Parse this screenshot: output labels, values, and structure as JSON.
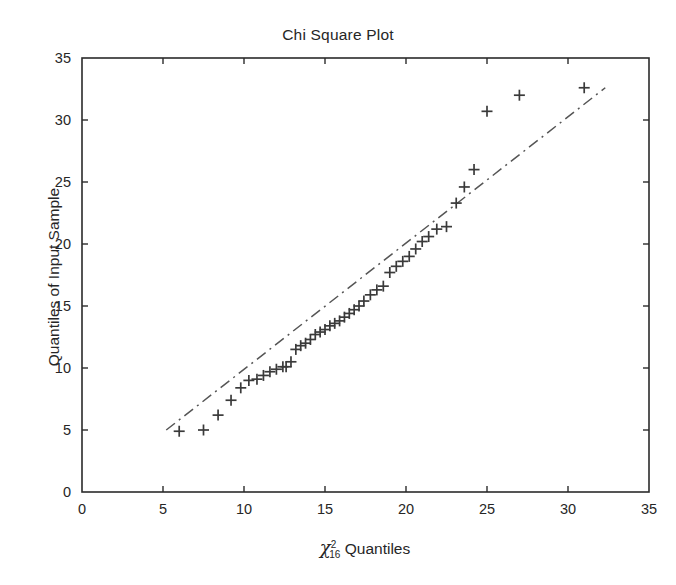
{
  "figure": {
    "width": 676,
    "height": 585,
    "background": "#ffffff",
    "axis_color": "#2b2b2b",
    "marker_color": "#3a3a3a",
    "line_color": "#555555"
  },
  "chart_data": {
    "type": "scatter",
    "title": "Chi Square Plot",
    "xlabel_parts": {
      "symbol": "χ",
      "superscript": "2",
      "subscript": "16",
      "text": " Quantiles"
    },
    "xlabel": "χ²₁₆ Quantiles",
    "ylabel": "Quantiles of Input Sample",
    "xlim": [
      0,
      35
    ],
    "ylim": [
      0,
      35
    ],
    "xticks": [
      0,
      5,
      10,
      15,
      20,
      25,
      30,
      35
    ],
    "yticks": [
      0,
      5,
      10,
      15,
      20,
      25,
      30,
      35
    ],
    "xticklabels": [
      "0",
      "5",
      "10",
      "15",
      "20",
      "25",
      "30",
      "35"
    ],
    "yticklabels": [
      "0",
      "5",
      "10",
      "15",
      "20",
      "25",
      "30",
      "35"
    ],
    "grid": false,
    "legend": null,
    "series": [
      {
        "name": "Sample quantiles",
        "marker": "plus",
        "style": "points",
        "color": "#3a3a3a",
        "points": [
          [
            6.0,
            4.9
          ],
          [
            7.5,
            5.0
          ],
          [
            8.4,
            6.2
          ],
          [
            9.2,
            7.4
          ],
          [
            9.8,
            8.4
          ],
          [
            10.3,
            9.0
          ],
          [
            10.8,
            9.1
          ],
          [
            11.2,
            9.4
          ],
          [
            11.6,
            9.7
          ],
          [
            12.0,
            9.9
          ],
          [
            12.4,
            10.1
          ],
          [
            12.6,
            10.1
          ],
          [
            12.9,
            10.5
          ],
          [
            13.2,
            11.5
          ],
          [
            13.5,
            11.8
          ],
          [
            13.8,
            12.0
          ],
          [
            14.1,
            12.3
          ],
          [
            14.4,
            12.7
          ],
          [
            14.7,
            12.9
          ],
          [
            15.0,
            13.1
          ],
          [
            15.3,
            13.4
          ],
          [
            15.6,
            13.6
          ],
          [
            15.9,
            13.8
          ],
          [
            16.2,
            14.1
          ],
          [
            16.5,
            14.4
          ],
          [
            16.8,
            14.7
          ],
          [
            17.1,
            15.0
          ],
          [
            17.4,
            15.4
          ],
          [
            17.8,
            15.9
          ],
          [
            18.2,
            16.3
          ],
          [
            18.6,
            16.6
          ],
          [
            19.0,
            17.7
          ],
          [
            19.4,
            18.2
          ],
          [
            19.8,
            18.6
          ],
          [
            20.2,
            19.0
          ],
          [
            20.6,
            19.6
          ],
          [
            21.0,
            20.2
          ],
          [
            21.4,
            20.6
          ],
          [
            21.9,
            21.2
          ],
          [
            22.5,
            21.4
          ],
          [
            23.1,
            23.3
          ],
          [
            23.6,
            24.6
          ],
          [
            24.2,
            26.0
          ],
          [
            25.0,
            30.7
          ],
          [
            27.0,
            32.0
          ],
          [
            31.0,
            32.6
          ]
        ]
      },
      {
        "name": "Reference line",
        "marker": "none",
        "style": "dashdot",
        "color": "#555555",
        "points": [
          [
            5.2,
            5.0
          ],
          [
            32.3,
            32.6
          ]
        ]
      }
    ]
  }
}
